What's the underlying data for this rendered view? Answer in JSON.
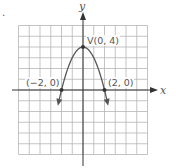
{
  "problem_marker": ".",
  "graph": {
    "function": "y = -x^2 + 4",
    "axes": {
      "x_label": "x",
      "y_label": "y"
    },
    "grid": {
      "x_range": [
        -6,
        6
      ],
      "y_range": [
        -6,
        6
      ],
      "cell_px": 10.75
    },
    "vertex": {
      "label": "V(0, 4)",
      "x": 0,
      "y": 4
    },
    "intercepts": [
      {
        "label": "(−2, 0)",
        "x": -2,
        "y": 0
      },
      {
        "label": "(2, 0)",
        "x": 2,
        "y": 0
      }
    ],
    "colors": {
      "grid": "#b5b5b5",
      "axis": "#333333",
      "curve": "#555555",
      "text": "#555555"
    }
  },
  "chart_data": {
    "type": "line",
    "title": "",
    "xlabel": "x",
    "ylabel": "y",
    "xlim": [
      -6,
      6
    ],
    "ylim": [
      -6,
      6
    ],
    "grid": true,
    "series": [
      {
        "name": "y = -x^2 + 4",
        "x": [
          -3.4,
          -3,
          -2.5,
          -2,
          -1.5,
          -1,
          -0.5,
          0,
          0.5,
          1,
          1.5,
          2,
          2.5,
          3,
          3.4
        ],
        "values": [
          -3.2,
          -5,
          -2.25,
          0,
          1.75,
          3,
          3.75,
          4,
          3.75,
          3,
          1.75,
          0,
          -2.25,
          -5,
          -3.2
        ]
      }
    ],
    "annotations": [
      {
        "text": "V(0, 4)",
        "x": 0,
        "y": 4
      },
      {
        "text": "(−2, 0)",
        "x": -2,
        "y": 0
      },
      {
        "text": "(2, 0)",
        "x": 2,
        "y": 0
      }
    ]
  }
}
